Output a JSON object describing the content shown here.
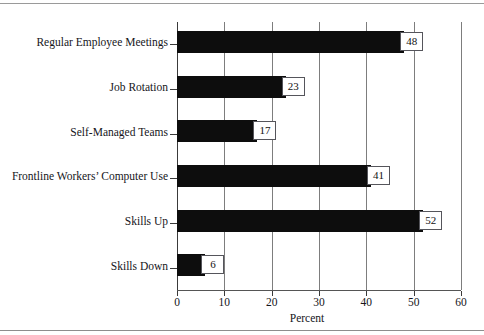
{
  "figure": {
    "background": "#ffffff",
    "bar_color": "#0d0d0d",
    "grid_color": "#7d7d7d",
    "text_color": "#15151a",
    "top_rule": true,
    "bottom_rule": true
  },
  "chart_data": {
    "type": "bar",
    "orientation": "horizontal",
    "title": "",
    "xlabel": "Percent",
    "ylabel": "",
    "xlim": [
      0,
      60
    ],
    "xticks": [
      0,
      10,
      20,
      30,
      40,
      50,
      60
    ],
    "xtick_labels": [
      "0",
      "10",
      "20",
      "30",
      "40",
      "50",
      "60"
    ],
    "grid": true,
    "legend": false,
    "data_labels": true,
    "categories": [
      "Regular Employee Meetings",
      "Job Rotation",
      "Self-Managed Teams",
      "Frontline Workers’ Computer Use",
      "Skills Up",
      "Skills Down"
    ],
    "values": [
      48,
      23,
      17,
      41,
      52,
      6
    ],
    "value_labels": [
      "48",
      "23",
      "17",
      "41",
      "52",
      "6"
    ]
  }
}
